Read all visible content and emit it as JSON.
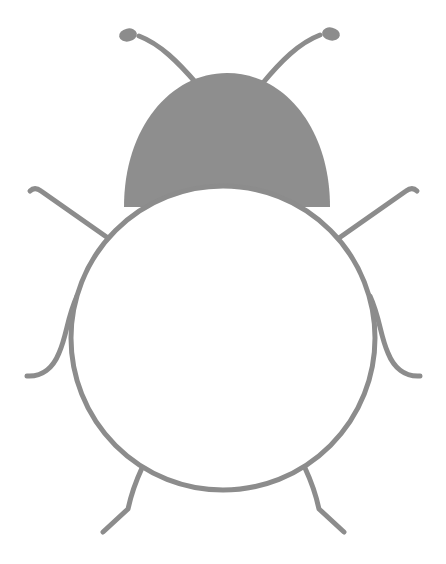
{
  "artwork": {
    "title": "Beetle",
    "subject": "ladybug-beetle-outline",
    "style": "flat line drawing",
    "canvas": {
      "width": 446,
      "height": 564,
      "background": "#ffffff"
    },
    "palette": {
      "stroke": "#8c8c8c",
      "head_fill": "#8e8e8e",
      "body_fill": "#ffffff",
      "background": "#ffffff"
    },
    "stroke_width": 5,
    "parts": {
      "body": {
        "name": "body",
        "shape": "circle",
        "cx": 223,
        "cy": 338,
        "r": 152,
        "fill": "#ffffff",
        "stroke": "#8c8c8c"
      },
      "head": {
        "name": "head",
        "shape": "dome",
        "cx": 227,
        "cy": 205,
        "rx": 103,
        "ry": 132,
        "fill": "#8e8e8e",
        "top": 73,
        "left": 124,
        "right": 330,
        "bottom": 207
      },
      "antennae": [
        {
          "name": "left-antenna",
          "path": "M 197 84 C 178 62 160 44 139 36",
          "tip": {
            "cx": 126,
            "cy": 35,
            "r": 8
          }
        },
        {
          "name": "right-antenna",
          "path": "M 262 84 C 281 61 299 43 320 35",
          "tip": {
            "cx": 333,
            "cy": 34,
            "r": 8
          }
        }
      ],
      "legs": [
        {
          "name": "front-left-leg",
          "path": "M 104 233 L 42 192 L 30 192"
        },
        {
          "name": "middle-left-leg",
          "path": "M 76 299 C 66 322 64 336 56 355 C 51 369 40 376 26 376"
        },
        {
          "name": "hind-left-leg",
          "path": "M 139 470 C 134 484 131 496 128 508 L 104 531"
        },
        {
          "name": "front-right-leg",
          "path": "M 343 233 L 405 192 L 417 192"
        },
        {
          "name": "middle-right-leg",
          "path": "M 371 299 C 381 322 383 336 391 355 C 396 369 407 376 421 376"
        },
        {
          "name": "hind-right-leg",
          "path": "M 308 470 C 313 484 316 496 319 508 L 343 531"
        }
      ]
    },
    "leg_count": 6,
    "antenna_count": 2
  }
}
